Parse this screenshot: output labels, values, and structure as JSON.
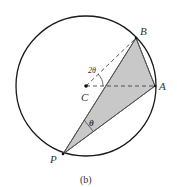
{
  "figure": {
    "caption": "(b)",
    "points": {
      "B": "B",
      "A": "A",
      "C": "C",
      "P": "P"
    },
    "angles": {
      "central": "2θ",
      "inscribed": "θ"
    },
    "colors": {
      "circle": "#1a1a1a",
      "shade": "#c8c8c8",
      "edge": "#555555",
      "dashed": "#444444"
    }
  }
}
